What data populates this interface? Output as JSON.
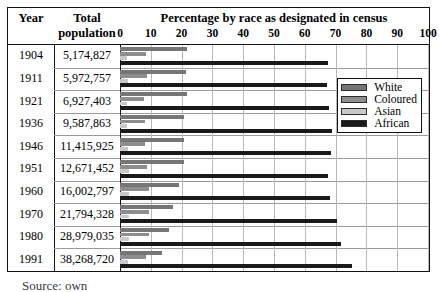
{
  "table": {
    "header": {
      "year_label": "Year",
      "population_label_line1": "Total",
      "population_label_line2": "population",
      "chart_title": "Percentage by race as designated in census"
    }
  },
  "legend": {
    "position": "inside-top-right",
    "items": [
      {
        "label": "White",
        "color": "#767676"
      },
      {
        "label": "Coloured",
        "color": "#8e8e8e"
      },
      {
        "label": "Asian",
        "color": "#c9c9c9"
      },
      {
        "label": "African",
        "color": "#1a1a1a"
      }
    ]
  },
  "caption": {
    "text": "Source: own"
  },
  "chart_data": {
    "type": "bar",
    "orientation": "horizontal",
    "title": "Percentage by race as designated in census",
    "xlabel": "",
    "ylabel": "Year",
    "xlim": [
      0,
      100
    ],
    "grid": true,
    "xticks": [
      0,
      10,
      20,
      30,
      40,
      50,
      60,
      70,
      80,
      90,
      100
    ],
    "categories": [
      "1904",
      "1911",
      "1921",
      "1936",
      "1946",
      "1951",
      "1960",
      "1970",
      "1980",
      "1991"
    ],
    "population": [
      "5,174,827",
      "5,972,757",
      "6,927,403",
      "9,587,863",
      "11,415,925",
      "12,671,452",
      "16,002,797",
      "21,794,328",
      "28,979,035",
      "38,268,720"
    ],
    "series": [
      {
        "name": "White",
        "color": "#767676",
        "values": [
          21.6,
          21.4,
          21.9,
          20.9,
          20.8,
          20.9,
          19.3,
          17.3,
          15.9,
          13.6
        ]
      },
      {
        "name": "Coloured",
        "color": "#8e8e8e",
        "values": [
          8.6,
          8.8,
          7.9,
          8.0,
          8.1,
          8.7,
          9.4,
          9.4,
          9.4,
          8.5
        ]
      },
      {
        "name": "Asian",
        "color": "#c9c9c9",
        "values": [
          2.4,
          2.6,
          2.4,
          2.3,
          2.5,
          2.9,
          3.0,
          2.9,
          2.8,
          2.6
        ]
      },
      {
        "name": "African",
        "color": "#1a1a1a",
        "values": [
          67.4,
          67.2,
          67.8,
          68.8,
          68.6,
          67.5,
          68.3,
          70.4,
          71.9,
          75.3
        ]
      }
    ]
  }
}
